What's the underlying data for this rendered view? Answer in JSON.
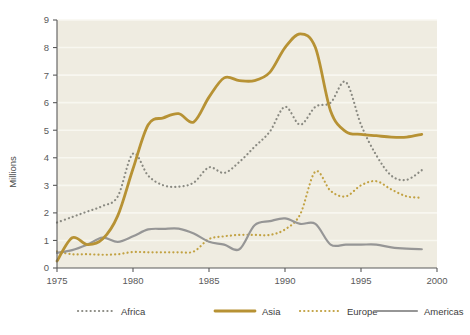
{
  "chart_data": {
    "type": "line",
    "title": "",
    "subtitle": "",
    "xlabel": "",
    "ylabel": "Millions",
    "xlim": [
      1975,
      2000
    ],
    "ylim": [
      0,
      9
    ],
    "xticks": [
      1975,
      1980,
      1985,
      1990,
      1995,
      2000
    ],
    "yticks": [
      0,
      1,
      2,
      3,
      4,
      5,
      6,
      7,
      8,
      9
    ],
    "grid": true,
    "grid_axis": "y",
    "legend_position": "bottom",
    "background_color": "#efece1",
    "page_background_color": "#ffffff",
    "gridline_color": "#f8f7f0",
    "axis_color": "#5a5a5a",
    "x": [
      1975,
      1976,
      1977,
      1978,
      1979,
      1980,
      1981,
      1982,
      1983,
      1984,
      1985,
      1986,
      1987,
      1988,
      1989,
      1990,
      1991,
      1992,
      1993,
      1994,
      1995,
      1996,
      1997,
      1998,
      1999
    ],
    "series": [
      {
        "name": "Africa",
        "color": "#8a8a82",
        "style": "dotted",
        "width": 2.2,
        "values": [
          1.65,
          1.85,
          2.05,
          2.25,
          2.6,
          4.15,
          3.35,
          3.0,
          2.95,
          3.1,
          3.65,
          3.45,
          3.85,
          4.4,
          4.95,
          5.85,
          5.2,
          5.85,
          6.0,
          6.75,
          5.2,
          4.1,
          3.35,
          3.2,
          3.55
        ]
      },
      {
        "name": "Asia",
        "color": "#b79234",
        "style": "solid",
        "width": 2.8,
        "values": [
          0.25,
          1.1,
          0.85,
          1.05,
          1.9,
          3.6,
          5.2,
          5.45,
          5.6,
          5.3,
          6.2,
          6.9,
          6.8,
          6.8,
          7.1,
          8.0,
          8.5,
          8.0,
          5.7,
          4.95,
          4.85,
          4.8,
          4.75,
          4.75,
          4.85
        ]
      },
      {
        "name": "Europe",
        "color": "#c2a243",
        "style": "dotted",
        "width": 2.2,
        "values": [
          0.6,
          0.5,
          0.5,
          0.48,
          0.5,
          0.58,
          0.57,
          0.57,
          0.57,
          0.6,
          1.05,
          1.15,
          1.2,
          1.2,
          1.2,
          1.4,
          1.95,
          3.5,
          2.8,
          2.6,
          3.0,
          3.15,
          2.85,
          2.6,
          2.55
        ]
      },
      {
        "name": "Americas",
        "color": "#969696",
        "style": "solid",
        "width": 2.2,
        "values": [
          0.55,
          0.65,
          0.85,
          1.1,
          0.95,
          1.15,
          1.4,
          1.42,
          1.43,
          1.25,
          0.95,
          0.85,
          0.68,
          1.55,
          1.7,
          1.8,
          1.6,
          1.6,
          0.85,
          0.85,
          0.85,
          0.85,
          0.75,
          0.7,
          0.68
        ]
      }
    ]
  },
  "axes": {
    "y_label": "Millions",
    "y_tick_labels": [
      "0",
      "1",
      "2",
      "3",
      "4",
      "5",
      "6",
      "7",
      "8",
      "9"
    ],
    "x_tick_labels": [
      "1975",
      "1980",
      "1985",
      "1990",
      "1995",
      "2000"
    ]
  },
  "legend": {
    "items": [
      {
        "label": "Africa",
        "color": "#8a8a82",
        "style": "dotted"
      },
      {
        "label": "Asia",
        "color": "#b79234",
        "style": "solid"
      },
      {
        "label": "Europe",
        "color": "#c2a243",
        "style": "dotted"
      },
      {
        "label": "Americas",
        "color": "#969696",
        "style": "solid"
      }
    ]
  }
}
